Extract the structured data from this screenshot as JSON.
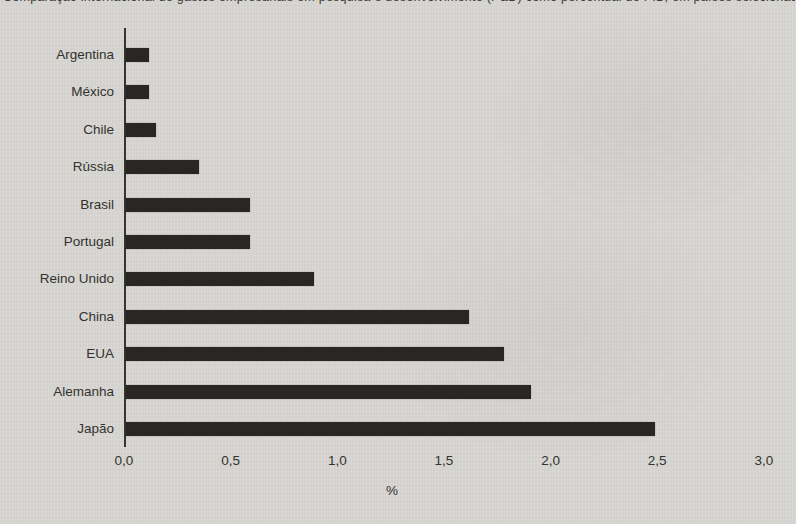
{
  "title": {
    "text": "Comparação internacional de gastos empresariais em pesquisa e desenvolvimento (P&D) como percentual do PIB, em países selecionados",
    "clipped": true
  },
  "chart_data": {
    "type": "bar",
    "orientation": "horizontal",
    "categories": [
      "Argentina",
      "México",
      "Chile",
      "Rússia",
      "Brasil",
      "Portugal",
      "Reino Unido",
      "China",
      "EUA",
      "Alemanha",
      "Japão"
    ],
    "values": [
      0.11,
      0.11,
      0.14,
      0.34,
      0.58,
      0.58,
      0.88,
      1.61,
      1.77,
      1.9,
      2.48
    ],
    "xlabel": "%",
    "xlim": [
      0,
      3.0
    ],
    "xticks": [
      "0,0",
      "0,5",
      "1,0",
      "1,5",
      "2,0",
      "2,5",
      "3,0"
    ],
    "xtick_values": [
      0,
      0.5,
      1.0,
      1.5,
      2.0,
      2.5,
      3.0
    ],
    "decimal_style": "comma",
    "grid": false,
    "legend": false,
    "bar_color": "#282724",
    "background_color": "#d8d7d3",
    "axis_color": "#34332f"
  }
}
